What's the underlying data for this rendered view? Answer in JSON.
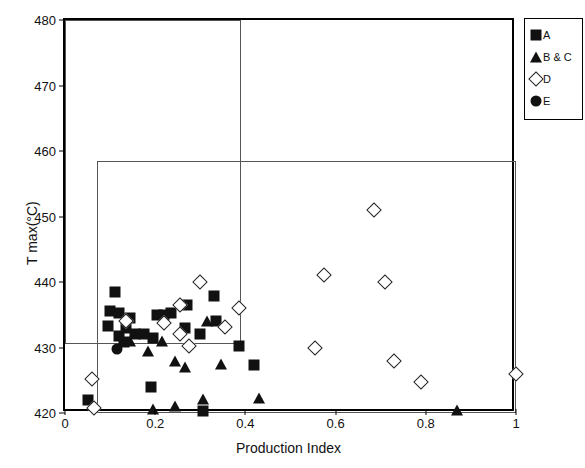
{
  "chart_data": {
    "type": "scatter",
    "title": "",
    "xlabel": "Production Index",
    "ylabel": "T max(°C)",
    "xlim": [
      0,
      1
    ],
    "ylim": [
      420,
      480
    ],
    "xticks": [
      "0",
      "0.2",
      "0.4",
      "0.6",
      "0.8",
      "1"
    ],
    "xtick_values": [
      0,
      0.2,
      0.4,
      0.6,
      0.8,
      1
    ],
    "yticks": [
      "420",
      "430",
      "440",
      "450",
      "460",
      "470",
      "480"
    ],
    "ytick_values": [
      420,
      430,
      440,
      450,
      460,
      470,
      480
    ],
    "grid": false,
    "legend_position": "outside-right-top",
    "annotations": [
      {
        "name": "upper-threshold-box",
        "type": "rect",
        "x0": 0.07,
        "y0": 420,
        "x1": 1.0,
        "y1": 458.5
      },
      {
        "name": "left-threshold-box",
        "type": "rect",
        "x0": 0.0,
        "y0": 430.5,
        "x1": 0.39,
        "y1": 480
      }
    ],
    "series": [
      {
        "name": "A",
        "marker": "filled-square",
        "color": "#111111",
        "points": [
          [
            0.05,
            422.0
          ],
          [
            0.11,
            438.5
          ],
          [
            0.1,
            435.5
          ],
          [
            0.12,
            435.3
          ],
          [
            0.095,
            433.3
          ],
          [
            0.135,
            433.0
          ],
          [
            0.145,
            434.5
          ],
          [
            0.12,
            431.8
          ],
          [
            0.13,
            430.8
          ],
          [
            0.155,
            432.0
          ],
          [
            0.175,
            432.0
          ],
          [
            0.19,
            424.0
          ],
          [
            0.205,
            435.0
          ],
          [
            0.22,
            435.0
          ],
          [
            0.235,
            435.2
          ],
          [
            0.195,
            431.5
          ],
          [
            0.27,
            436.5
          ],
          [
            0.265,
            433.0
          ],
          [
            0.3,
            432.0
          ],
          [
            0.305,
            420.3
          ],
          [
            0.33,
            437.8
          ],
          [
            0.335,
            434.0
          ],
          [
            0.385,
            430.3
          ],
          [
            0.42,
            427.3
          ]
        ]
      },
      {
        "name": "B & C",
        "marker": "filled-triangle",
        "color": "#111111",
        "points": [
          [
            0.145,
            431.0
          ],
          [
            0.185,
            429.5
          ],
          [
            0.195,
            420.6
          ],
          [
            0.215,
            431.0
          ],
          [
            0.245,
            428.0
          ],
          [
            0.245,
            421.0
          ],
          [
            0.265,
            427.0
          ],
          [
            0.305,
            422.2
          ],
          [
            0.315,
            434.0
          ],
          [
            0.345,
            427.5
          ],
          [
            0.43,
            422.3
          ],
          [
            0.87,
            420.5
          ]
        ]
      },
      {
        "name": "D",
        "marker": "open-diamond",
        "color": "#222222",
        "points": [
          [
            0.06,
            425.2
          ],
          [
            0.065,
            420.7
          ],
          [
            0.135,
            434.0
          ],
          [
            0.22,
            433.8
          ],
          [
            0.255,
            432.0
          ],
          [
            0.255,
            436.5
          ],
          [
            0.275,
            430.3
          ],
          [
            0.3,
            440.0
          ],
          [
            0.355,
            433.2
          ],
          [
            0.385,
            436.0
          ],
          [
            0.555,
            430.0
          ],
          [
            0.575,
            441.0
          ],
          [
            0.685,
            451.0
          ],
          [
            0.71,
            440.0
          ],
          [
            0.73,
            428.0
          ],
          [
            0.79,
            424.8
          ],
          [
            1.0,
            426.0
          ]
        ]
      },
      {
        "name": "E",
        "marker": "filled-circle",
        "color": "#111111",
        "points": [
          [
            0.115,
            429.8
          ]
        ]
      }
    ]
  },
  "legend": {
    "items": [
      {
        "label": "A",
        "marker": "filled-square"
      },
      {
        "label": "B & C",
        "marker": "filled-triangle"
      },
      {
        "label": "D",
        "marker": "open-diamond"
      },
      {
        "label": "E",
        "marker": "filled-circle"
      }
    ]
  }
}
